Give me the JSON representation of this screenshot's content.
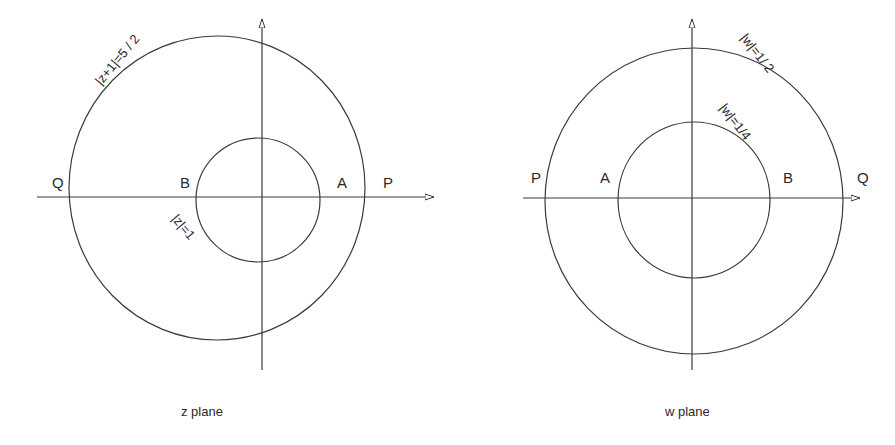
{
  "diagrams": [
    {
      "id": "z-plane",
      "caption": "z plane",
      "points": {
        "Q": "Q",
        "B": "B",
        "A": "A",
        "P": "P"
      },
      "curves": {
        "outer": "|z+1|=5 / 2",
        "inner": "|z|=1"
      }
    },
    {
      "id": "w-plane",
      "caption": "w plane",
      "points": {
        "P": "P",
        "A": "A",
        "B": "B",
        "Q": "Q"
      },
      "curves": {
        "outer": "|w|=1/ 2",
        "inner": "|w|=1/4"
      }
    }
  ],
  "colors": {
    "stroke": "#3a3a3a",
    "text": "#2a2a2a",
    "background": "#ffffff"
  }
}
